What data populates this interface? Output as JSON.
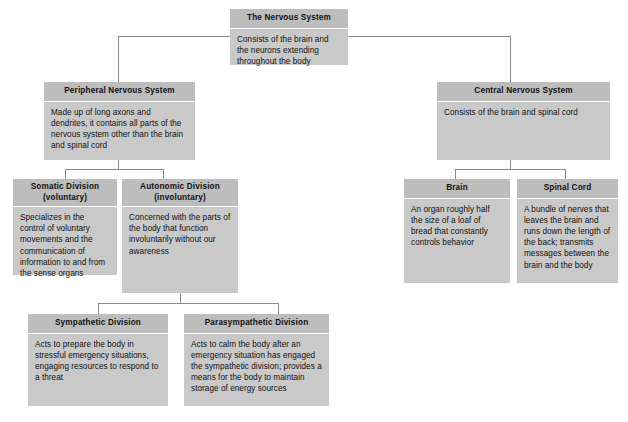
{
  "diagram": {
    "title": "The Nervous System",
    "type": "hierarchy-flowchart",
    "colors": {
      "header_fill": "#bdbdbd",
      "body_fill": "#c9c9c9",
      "connector": "#8a8a8a",
      "background": "#ffffff",
      "text": "#111111"
    }
  },
  "nodes": {
    "nervous_system": {
      "title": "The Nervous System",
      "description": "Consists of the brain and the neurons extending throughout the body"
    },
    "peripheral": {
      "title": "Peripheral Nervous System",
      "description": "Made up of long axons and dendrites, it contains all parts of the nervous system other than the brain and spinal cord"
    },
    "central": {
      "title": "Central Nervous System",
      "description": "Consists of the brain and spinal cord"
    },
    "somatic": {
      "title_line1": "Somatic Division",
      "title_line2": "(voluntary)",
      "description": "Specializes in the control of voluntary movements and the communication of information to and from the sense organs"
    },
    "autonomic": {
      "title_line1": "Autonomic Division",
      "title_line2": "(involuntary)",
      "description": "Concerned with the parts of the body that function involuntarily without our awareness"
    },
    "brain": {
      "title": "Brain",
      "description": "An organ roughly half the size of a loaf of bread that constantly controls behavior"
    },
    "spinal_cord": {
      "title": "Spinal Cord",
      "description": "A bundle of nerves that leaves the brain and runs down the length of the back; transmits messages between the brain and the body"
    },
    "sympathetic": {
      "title": "Sympathetic Division",
      "description": "Acts to prepare the body in stressful emergency situations, engaging resources to respond to a threat"
    },
    "parasympathetic": {
      "title": "Parasympathetic Division",
      "description": "Acts to calm the body after an emergency situation has engaged the sympathetic division; provides a means for the body to maintain storage of energy sources"
    }
  },
  "edges": [
    {
      "from": "nervous_system",
      "to": "peripheral"
    },
    {
      "from": "nervous_system",
      "to": "central"
    },
    {
      "from": "peripheral",
      "to": "somatic"
    },
    {
      "from": "peripheral",
      "to": "autonomic"
    },
    {
      "from": "central",
      "to": "brain"
    },
    {
      "from": "central",
      "to": "spinal_cord"
    },
    {
      "from": "autonomic",
      "to": "sympathetic"
    },
    {
      "from": "autonomic",
      "to": "parasympathetic"
    }
  ]
}
